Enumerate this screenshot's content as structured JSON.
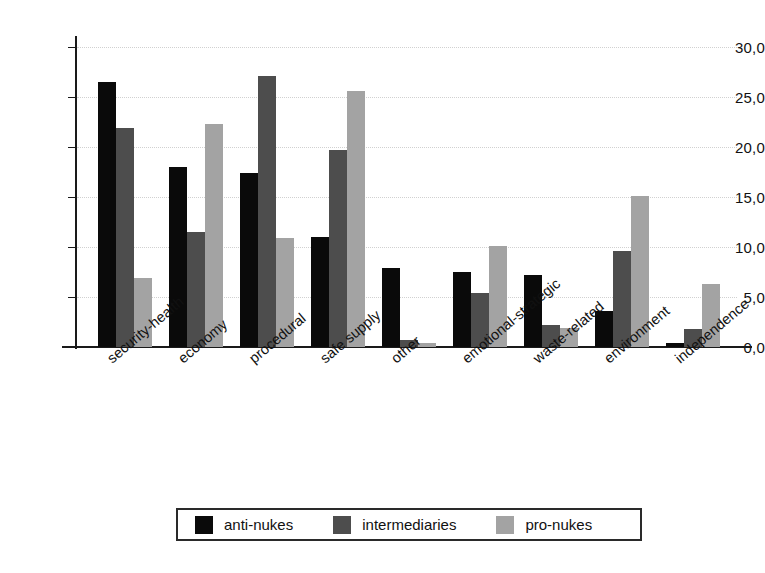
{
  "chart_data": {
    "type": "bar",
    "title": "",
    "subtitle": "",
    "xlabel": "",
    "ylabel": "",
    "ylim": [
      0,
      30
    ],
    "grid": true,
    "legend_position": "bottom",
    "decimal_separator": ",",
    "categories": [
      "security-health",
      "economy",
      "procedural",
      "safe supply",
      "other",
      "emotional-strategic",
      "waste-related",
      "environment",
      "independence"
    ],
    "ytick_labels": [
      "0,0",
      "5,0",
      "10,0",
      "15,0",
      "20,0",
      "25,0",
      "30,0"
    ],
    "ytick_values": [
      0,
      5,
      10,
      15,
      20,
      25,
      30
    ],
    "series": [
      {
        "name": "anti-nukes",
        "color": "#0a0a0a",
        "values": [
          26.5,
          18.0,
          17.4,
          11.0,
          7.9,
          7.5,
          7.2,
          3.6,
          0.4
        ]
      },
      {
        "name": "intermediaries",
        "color": "#4d4d4d",
        "values": [
          21.9,
          11.5,
          27.1,
          19.7,
          0.7,
          5.4,
          2.2,
          9.6,
          1.8
        ]
      },
      {
        "name": "pro-nukes",
        "color": "#a3a3a3",
        "values": [
          6.9,
          22.3,
          10.9,
          25.6,
          0.4,
          10.1,
          1.9,
          15.1,
          6.3
        ]
      }
    ]
  },
  "legend": {
    "items": [
      {
        "label": "anti-nukes"
      },
      {
        "label": "intermediaries"
      },
      {
        "label": "pro-nukes"
      }
    ]
  }
}
